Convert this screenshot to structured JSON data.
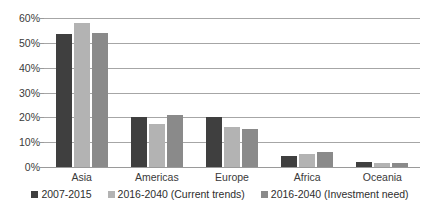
{
  "chart_data": {
    "type": "bar",
    "title": "",
    "subtitle": "",
    "xlabel": "",
    "ylabel": "",
    "categories": [
      "Asia",
      "Americas",
      "Europe",
      "Africa",
      "Oceania"
    ],
    "series": [
      {
        "name": "2007-2015",
        "color": "#3f3f3f",
        "values": [
          53.5,
          20.0,
          20.0,
          4.5,
          2.0
        ]
      },
      {
        "name": "2016-2040 (Current trends)",
        "color": "#b3b3b3",
        "values": [
          58.0,
          17.5,
          16.0,
          5.2,
          1.8
        ]
      },
      {
        "name": "2016-2040 (Investment need)",
        "color": "#8a8a8a",
        "values": [
          54.0,
          21.0,
          15.5,
          6.0,
          1.8
        ]
      }
    ],
    "ylim": [
      0,
      60
    ],
    "ytick_values": [
      0,
      10,
      20,
      30,
      40,
      50,
      60
    ],
    "ytick_labels": [
      "0%",
      "10%",
      "20%",
      "30%",
      "40%",
      "50%",
      "60%"
    ],
    "value_suffix": "%",
    "grid": true,
    "grid_axis": "y",
    "legend_position": "bottom",
    "legend_marker": "square"
  }
}
